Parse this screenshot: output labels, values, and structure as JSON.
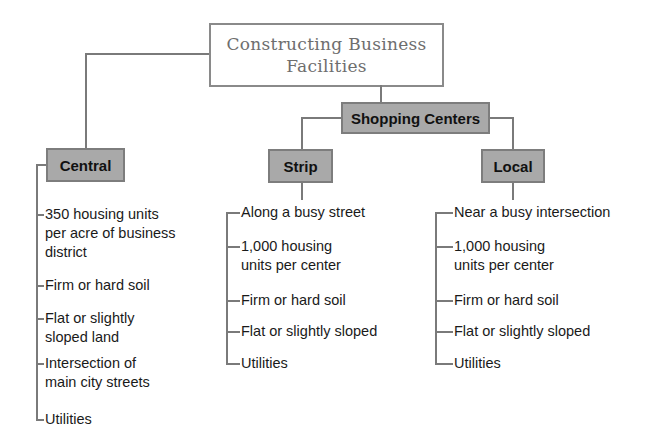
{
  "diagram": {
    "title_line1": "Constructing Business",
    "title_line2": "Facilities",
    "shopping_centers": "Shopping Centers",
    "colors": {
      "node_fill": "#a9a9a9",
      "node_border": "#7d7d7d",
      "line": "#7a7a7a",
      "title_text": "#6e6e6e"
    },
    "central": {
      "label": "Central",
      "items": [
        {
          "line1": "350 housing units",
          "line2": "per acre of business",
          "line3": "district"
        },
        {
          "line1": "Firm or hard soil"
        },
        {
          "line1": "Flat or slightly",
          "line2": "sloped land"
        },
        {
          "line1": "Intersection of",
          "line2": "main city streets"
        },
        {
          "line1": "Utilities"
        }
      ]
    },
    "strip": {
      "label": "Strip",
      "items": [
        {
          "line1": "Along a busy street"
        },
        {
          "line1": "1,000 housing",
          "line2": "units per center"
        },
        {
          "line1": "Firm or hard soil"
        },
        {
          "line1": "Flat or slightly sloped"
        },
        {
          "line1": "Utilities"
        }
      ]
    },
    "local": {
      "label": "Local",
      "items": [
        {
          "line1": "Near a busy intersection"
        },
        {
          "line1": "1,000 housing",
          "line2": "units per center"
        },
        {
          "line1": "Firm or hard soil"
        },
        {
          "line1": "Flat or slightly sloped"
        },
        {
          "line1": "Utilities"
        }
      ]
    }
  }
}
